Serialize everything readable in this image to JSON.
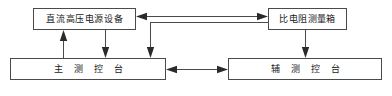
{
  "diagram": {
    "canvas": {
      "width": 392,
      "height": 96
    },
    "style": {
      "background": "#ffffff",
      "box_border": "#4a4a4a",
      "line": "#4a4a4a",
      "arrow_fill": "#2b2b2b",
      "text": "#1a1a1a"
    },
    "nodes": [
      {
        "id": "hv-supply",
        "label": "直流高压电源设备",
        "row": "top",
        "position": "top-left"
      },
      {
        "id": "resistivity-box",
        "label": "比电阻测量箱",
        "row": "top",
        "position": "top-right"
      },
      {
        "id": "main-console",
        "label": "主测控台",
        "row": "bottom",
        "position": "bottom-left"
      },
      {
        "id": "aux-console",
        "label": "辅测控台",
        "row": "bottom",
        "position": "bottom-right"
      }
    ],
    "edges": [
      {
        "id": "resistivity-to-hv",
        "from": "resistivity-box",
        "to": "hv-supply",
        "arrows": "both",
        "routing": "horizontal"
      },
      {
        "id": "resistivity-to-main",
        "from": "resistivity-box",
        "to": "main-console",
        "arrows": "single",
        "routing": "elbow"
      },
      {
        "id": "main-to-hv",
        "from": "main-console",
        "to": "hv-supply",
        "arrows": "single",
        "routing": "vertical"
      },
      {
        "id": "hv-to-main",
        "from": "hv-supply",
        "to": "main-console",
        "arrows": "single",
        "routing": "vertical"
      },
      {
        "id": "resistivity-to-aux",
        "from": "resistivity-box",
        "to": "aux-console",
        "arrows": "single",
        "routing": "vertical"
      },
      {
        "id": "main-to-aux",
        "from": "main-console",
        "to": "aux-console",
        "arrows": "both",
        "routing": "horizontal"
      }
    ]
  }
}
